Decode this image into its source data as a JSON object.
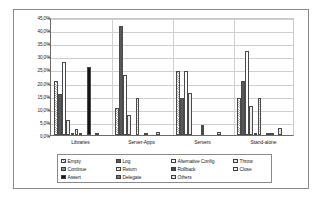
{
  "chart_data": {
    "type": "bar",
    "title": "",
    "xlabel": "",
    "ylabel": "",
    "ylim": [
      0,
      45
    ],
    "grid": true,
    "legend_position": "bottom",
    "categories": [
      "Libraries",
      "Server-Apps",
      "Servers",
      "Stand-alone"
    ],
    "ytick_labels": [
      "45,0%",
      "40,0%",
      "35,0%",
      "30,0%",
      "25,0%",
      "20,0%",
      "15,0%",
      "10,0%",
      "5,0%",
      "0,0%"
    ],
    "ytick_values": [
      45,
      40,
      35,
      30,
      25,
      20,
      15,
      10,
      5,
      0
    ],
    "series": [
      {
        "name": "Empty",
        "color": "#a8a8a8",
        "pattern": "hatch",
        "values": [
          20.5,
          10.4,
          24.4,
          14.0
        ]
      },
      {
        "name": "Log",
        "color": "#585858",
        "pattern": "solid",
        "values": [
          15.5,
          41.5,
          14.0,
          20.5
        ]
      },
      {
        "name": "Alternative Config",
        "color": "#fdfdfd",
        "pattern": "plain",
        "values": [
          28.0,
          23.0,
          24.4,
          32.2
        ]
      },
      {
        "name": "Throw",
        "color": "#ededed",
        "pattern": "plain",
        "values": [
          5.8,
          7.7,
          16.1,
          11.0
        ]
      },
      {
        "name": "Continue",
        "color": "#8f8f8f",
        "pattern": "dense",
        "values": [
          0.3,
          0.0,
          0.0,
          0.2
        ]
      },
      {
        "name": "Return",
        "color": "#c4c4c4",
        "pattern": "hatch",
        "values": [
          2.4,
          14.2,
          0.0,
          14.2
        ]
      },
      {
        "name": "Rollback",
        "color": "#4a4a4a",
        "pattern": "solid",
        "values": [
          0.4,
          0.0,
          3.7,
          0.0
        ]
      },
      {
        "name": "Close",
        "color": "#f2f2f2",
        "pattern": "plain",
        "values": [
          0.0,
          0.5,
          0.0,
          0.6
        ]
      },
      {
        "name": "Assert",
        "color": "#151515",
        "pattern": "solid",
        "values": [
          26.0,
          0.0,
          0.0,
          0.5
        ]
      },
      {
        "name": "Delegate",
        "color": "#787878",
        "pattern": "dense",
        "values": [
          0.0,
          0.0,
          0.0,
          0.0
        ]
      },
      {
        "name": "Others",
        "color": "#e2e2e2",
        "pattern": "plain",
        "values": [
          0.6,
          1.2,
          1.3,
          2.5
        ]
      }
    ]
  }
}
